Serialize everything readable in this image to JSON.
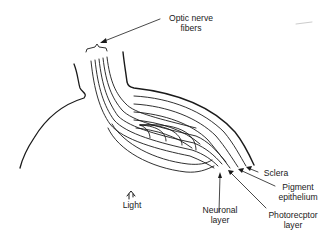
{
  "diagram": {
    "stroke_color": "#1a1a1a",
    "background": "#ffffff",
    "labels": {
      "optic_nerve": {
        "line1": "Optic nerve",
        "line2": "fibers"
      },
      "sclera": {
        "line1": "Sclera"
      },
      "pigment_epithelium": {
        "line1": "Pigment",
        "line2": "epithelium"
      },
      "neuronal_layer": {
        "line1": "Neuronal",
        "line2": "layer"
      },
      "photoreceptor_layer": {
        "line1": "Photorecptor",
        "line2": "layer"
      },
      "light": {
        "line1": "Light"
      }
    },
    "icons": {
      "light_arrow": "upward-arrow-icon"
    }
  }
}
